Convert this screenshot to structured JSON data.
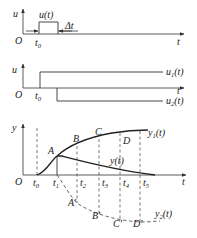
{
  "panel_pulse": {
    "y_axis_label": "u",
    "x_axis_label": "t",
    "origin_label": "O",
    "signal_label": "u(t)",
    "tick_label": "t0",
    "width_label": "Δt"
  },
  "panel_steps": {
    "y_axis_label": "u",
    "x_axis_label": "t",
    "origin_label": "O",
    "tick_label": "t0",
    "series": [
      {
        "label": "u1(t)",
        "description": "positive step at t0"
      },
      {
        "label": "u2(t)",
        "description": "negative step at t0 + Δt"
      }
    ]
  },
  "panel_response": {
    "y_axis_label": "y",
    "x_axis_label": "t",
    "origin_label": "O",
    "ticks": [
      "t0",
      "t1",
      "t2",
      "t3",
      "t4",
      "t5"
    ],
    "curves": [
      {
        "label": "y1(t)",
        "style": "solid",
        "points": [
          "A",
          "B",
          "C",
          "D"
        ]
      },
      {
        "label": "y(t)",
        "style": "solid"
      },
      {
        "label": "y2(t)",
        "style": "dashed",
        "points": [
          "A'",
          "B'",
          "C'",
          "D'"
        ]
      }
    ],
    "point_labels": {
      "A": "A",
      "B": "B",
      "C": "C",
      "D": "D",
      "A_prime": "A'",
      "B_prime": "B'",
      "C_prime": "C'",
      "D_prime": "D'"
    }
  }
}
